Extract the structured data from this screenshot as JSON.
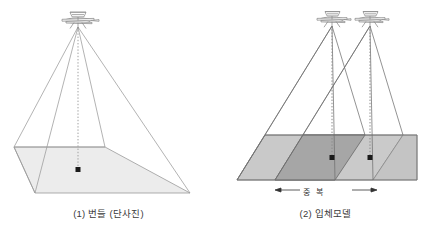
{
  "figure": {
    "title": "",
    "panels": [
      {
        "id": "single-photo",
        "caption": "(1) 번들 (단사진)",
        "aircraft_count": 1,
        "nadir_points": 1,
        "icon": "airplane-icon",
        "footprint_fill": "#ececec",
        "line_color": "#8c8c8c",
        "plumb_line_style": "dotted"
      },
      {
        "id": "stereo-model",
        "caption": "(2) 입체모델",
        "aircraft_count": 2,
        "nadir_points": 2,
        "icon": "airplane-icon",
        "footprint_fill_light": "#c9c9c9",
        "footprint_fill_overlap": "#a6a6a6",
        "footprint_fill_pale": "#dcdcdc",
        "line_color": "#6f6f6f",
        "plumb_line_style": "dotted",
        "overlap_label": "중  복",
        "overlap_arrow": "double-headed-arrow"
      }
    ],
    "colors": {
      "background": "#ffffff",
      "stroke": "#8c8c8c",
      "stroke_dark": "#5a5a5a",
      "text": "#3b3b3b",
      "point": "#1a1a1a"
    }
  }
}
